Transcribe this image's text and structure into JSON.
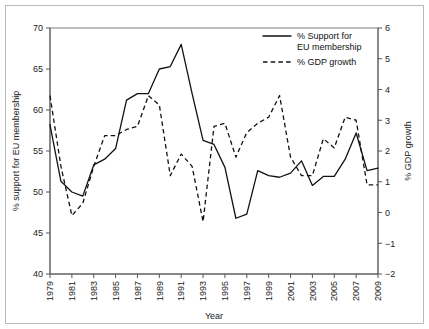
{
  "chart_data": {
    "type": "line",
    "title": "",
    "xlabel": "Year",
    "ylabel": "% support for EU membership",
    "y2label": "% GDP growth",
    "grid": false,
    "legend_position": "top-right",
    "xlim": [
      1979,
      2009
    ],
    "ylim": [
      40,
      70
    ],
    "y2lim": [
      -2,
      6
    ],
    "xticks": [
      1979,
      1981,
      1983,
      1985,
      1987,
      1989,
      1991,
      1993,
      1995,
      1997,
      1999,
      2001,
      2003,
      2005,
      2007,
      2009
    ],
    "xticklabels": [
      "1979",
      "1981",
      "1983",
      "1985",
      "1987",
      "1989",
      "1991",
      "1993",
      "1995",
      "1997",
      "1999",
      "2001",
      "2003",
      "2005",
      "2007",
      "2009"
    ],
    "yticks": [
      40,
      45,
      50,
      55,
      60,
      65,
      70
    ],
    "yticklabels": [
      "40",
      "45",
      "50",
      "55",
      "60",
      "65",
      "70"
    ],
    "y2ticks": [
      -2,
      -1,
      0,
      1,
      2,
      3,
      4,
      5,
      6
    ],
    "y2ticklabels": [
      "-2",
      "-1",
      "0",
      "1",
      "2",
      "3",
      "4",
      "5",
      "6"
    ],
    "x": [
      1979,
      1980,
      1981,
      1982,
      1983,
      1984,
      1985,
      1986,
      1987,
      1988,
      1989,
      1990,
      1991,
      1992,
      1993,
      1994,
      1995,
      1996,
      1997,
      1998,
      1999,
      2000,
      2001,
      2002,
      2003,
      2004,
      2005,
      2006,
      2007,
      2008,
      2009
    ],
    "series": [
      {
        "name": "% Support for EU membership",
        "axis": "left",
        "style": "solid",
        "values": [
          58.2,
          51.3,
          50.0,
          49.5,
          53.3,
          54.0,
          55.3,
          61.2,
          62.0,
          62.0,
          65.0,
          65.3,
          68.0,
          62.0,
          56.3,
          55.8,
          53.0,
          46.8,
          47.3,
          52.6,
          52.0,
          51.8,
          52.3,
          53.8,
          50.8,
          51.9,
          51.9,
          54.0,
          57.2,
          52.6,
          52.9
        ]
      },
      {
        "name": "% GDP growth",
        "axis": "right",
        "style": "dashed",
        "values": [
          3.8,
          1.5,
          -0.1,
          0.3,
          1.5,
          2.5,
          2.5,
          2.7,
          2.8,
          3.8,
          3.5,
          1.2,
          1.9,
          1.5,
          -0.3,
          2.8,
          2.9,
          1.8,
          2.6,
          2.9,
          3.1,
          3.8,
          1.8,
          1.2,
          1.2,
          2.4,
          2.1,
          3.1,
          3.0,
          0.9,
          0.9
        ]
      }
    ]
  },
  "legend": {
    "entries": [
      {
        "label_line1": "% Support for",
        "label_line2": "EU membership",
        "style": "solid"
      },
      {
        "label_line1": "% GDP growth",
        "label_line2": "",
        "style": "dashed"
      }
    ]
  },
  "axes": {
    "x_title": "Year",
    "y_left_title": "% support for EU membership",
    "y_right_title": "% GDP growth"
  }
}
